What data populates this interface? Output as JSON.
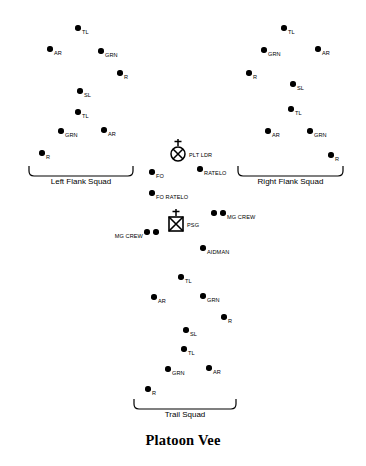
{
  "title": "Platoon Vee",
  "diagram": {
    "width": 366,
    "height": 466,
    "background": "#ffffff",
    "ink": "#000000"
  },
  "groups": [
    {
      "id": "left-flank-squad",
      "caption": "Left Flank Squad",
      "bracket": {
        "x": 28,
        "y": 166,
        "width": 106
      },
      "nodes": [
        {
          "id": "lf-tl-1",
          "label": "TL",
          "x": 78,
          "y": 28
        },
        {
          "id": "lf-ar-1",
          "label": "AR",
          "x": 50,
          "y": 49
        },
        {
          "id": "lf-grn-1",
          "label": "GRN",
          "x": 101,
          "y": 51
        },
        {
          "id": "lf-r-1",
          "label": "R",
          "x": 120,
          "y": 73
        },
        {
          "id": "lf-sl",
          "label": "SL",
          "x": 80,
          "y": 91
        },
        {
          "id": "lf-tl-2",
          "label": "TL",
          "x": 78,
          "y": 112
        },
        {
          "id": "lf-grn-2",
          "label": "GRN",
          "x": 61,
          "y": 131
        },
        {
          "id": "lf-ar-2",
          "label": "AR",
          "x": 104,
          "y": 130
        },
        {
          "id": "lf-r-2",
          "label": "R",
          "x": 42,
          "y": 153
        }
      ]
    },
    {
      "id": "right-flank-squad",
      "caption": "Right Flank Squad",
      "bracket": {
        "x": 237,
        "y": 166,
        "width": 107
      },
      "nodes": [
        {
          "id": "rf-tl-1",
          "label": "TL",
          "x": 284,
          "y": 28
        },
        {
          "id": "rf-grn-1",
          "label": "GRN",
          "x": 264,
          "y": 50
        },
        {
          "id": "rf-ar-1",
          "label": "AR",
          "x": 318,
          "y": 49
        },
        {
          "id": "rf-r-1",
          "label": "R",
          "x": 249,
          "y": 73
        },
        {
          "id": "rf-sl",
          "label": "SL",
          "x": 293,
          "y": 84
        },
        {
          "id": "rf-tl-2",
          "label": "TL",
          "x": 291,
          "y": 109
        },
        {
          "id": "rf-ar-2",
          "label": "AR",
          "x": 268,
          "y": 131
        },
        {
          "id": "rf-grn-2",
          "label": "GRN",
          "x": 310,
          "y": 131
        },
        {
          "id": "rf-r-2",
          "label": "R",
          "x": 331,
          "y": 155
        }
      ]
    },
    {
      "id": "trail-squad",
      "caption": "Trail Squad",
      "bracket": {
        "x": 133,
        "y": 399,
        "width": 104
      },
      "nodes": [
        {
          "id": "ts-tl-1",
          "label": "TL",
          "x": 181,
          "y": 277
        },
        {
          "id": "ts-ar-1",
          "label": "AR",
          "x": 154,
          "y": 297
        },
        {
          "id": "ts-grn-1",
          "label": "GRN",
          "x": 203,
          "y": 296
        },
        {
          "id": "ts-r-1",
          "label": "R",
          "x": 224,
          "y": 317
        },
        {
          "id": "ts-sl",
          "label": "SL",
          "x": 186,
          "y": 330
        },
        {
          "id": "ts-tl-2",
          "label": "TL",
          "x": 184,
          "y": 349
        },
        {
          "id": "ts-grn-2",
          "label": "GRN",
          "x": 168,
          "y": 369
        },
        {
          "id": "ts-ar-2",
          "label": "AR",
          "x": 209,
          "y": 368
        },
        {
          "id": "ts-r-2",
          "label": "R",
          "x": 148,
          "y": 389
        }
      ]
    }
  ],
  "headquarters": {
    "units": [
      {
        "id": "plt-ldr",
        "label": "PLT LDR",
        "symbol": "circle-x-antenna",
        "x": 178,
        "y": 151
      },
      {
        "id": "psg",
        "label": "PSG",
        "symbol": "square-x-antenna",
        "x": 176,
        "y": 221
      }
    ],
    "nodes": [
      {
        "id": "fo",
        "label": "FO",
        "x": 152,
        "y": 172
      },
      {
        "id": "ratelo",
        "label": "RATELO",
        "x": 200,
        "y": 169
      },
      {
        "id": "fo-ratelo",
        "label": "FO RATELO",
        "x": 152,
        "y": 193
      },
      {
        "id": "aidman",
        "label": "AIDMAN",
        "x": 203,
        "y": 248
      }
    ],
    "crews": [
      {
        "id": "mg-crew-right",
        "label": "MG CREW",
        "x": 214,
        "y": 213,
        "align": "right"
      },
      {
        "id": "mg-crew-left",
        "label": "MG CREW",
        "x": 147,
        "y": 232,
        "align": "left"
      }
    ]
  }
}
